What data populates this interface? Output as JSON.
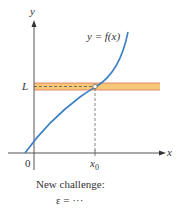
{
  "diagram": {
    "y_axis_label": "y",
    "x_axis_label": "x",
    "curve_label": "y = f(x)",
    "origin_label": "0",
    "limit_label": "L",
    "x0_label": "x",
    "x0_subscript": "0",
    "caption_line1": "New challenge:",
    "caption_line2": "ε = ···",
    "colors": {
      "curve": "#3b7fc4",
      "band_fill": "#f6c878",
      "band_edge": "#e0705a",
      "axis": "#555555",
      "dashed": "#555555"
    }
  }
}
